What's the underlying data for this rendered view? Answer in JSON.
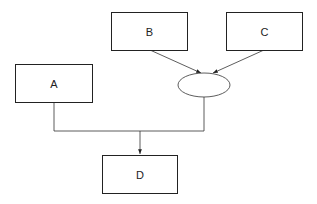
{
  "diagram": {
    "nodes": [
      {
        "id": "A",
        "label": "A",
        "shape": "rectangle"
      },
      {
        "id": "B",
        "label": "B",
        "shape": "rectangle"
      },
      {
        "id": "C",
        "label": "C",
        "shape": "rectangle"
      },
      {
        "id": "J",
        "label": "",
        "shape": "ellipse"
      },
      {
        "id": "D",
        "label": "D",
        "shape": "rectangle"
      }
    ],
    "edges": [
      {
        "from": "B",
        "to": "J",
        "arrow": true
      },
      {
        "from": "C",
        "to": "J",
        "arrow": true
      },
      {
        "from": "A",
        "to": "D",
        "arrow": true
      },
      {
        "from": "J",
        "to": "D",
        "arrow": true
      }
    ],
    "colors": {
      "stroke": "#222222",
      "background": "#ffffff"
    }
  }
}
